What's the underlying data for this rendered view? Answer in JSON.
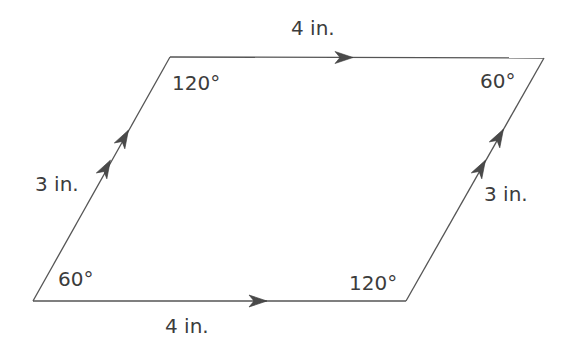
{
  "diagram": {
    "shape": "parallelogram",
    "colors": {
      "stroke": "#555555",
      "text": "#3c3c3c",
      "arrow": "#4a4a4a",
      "background": "#ffffff"
    },
    "vertices": {
      "top_left": [
        170,
        57
      ],
      "top_right": [
        544,
        58
      ],
      "bottom_right": [
        406,
        301
      ],
      "bottom_left": [
        33,
        301
      ]
    },
    "sides": {
      "top": {
        "label": "4 in.",
        "arrow_count": 1
      },
      "bottom": {
        "label": "4 in.",
        "arrow_count": 1
      },
      "left": {
        "label": "3 in.",
        "arrow_count": 2
      },
      "right": {
        "label": "3 in.",
        "arrow_count": 2
      }
    },
    "angles": {
      "top_left": "120°",
      "top_right": "60°",
      "bottom_right": "120°",
      "bottom_left": "60°"
    }
  }
}
